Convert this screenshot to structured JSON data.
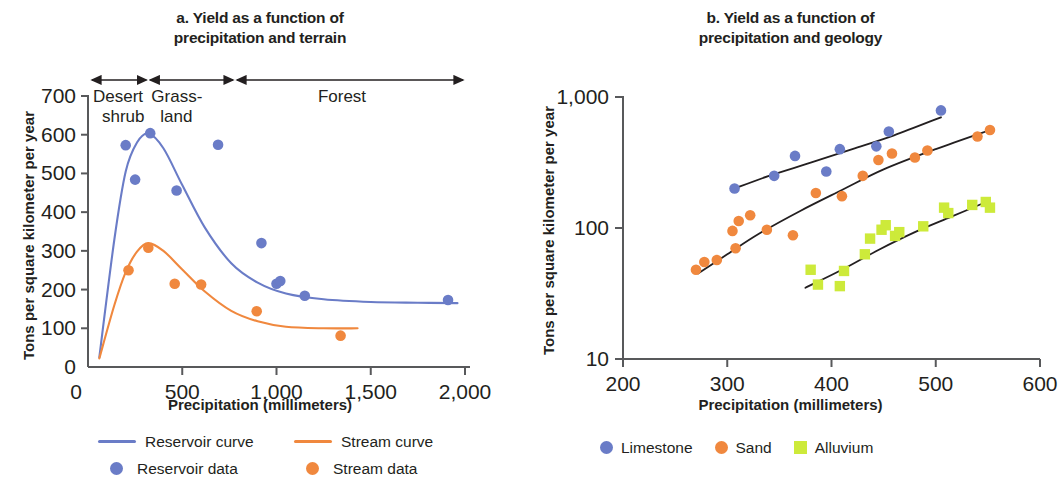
{
  "colors": {
    "reservoir_blue": "#6a7cc7",
    "stream_orange": "#f0883e",
    "limestone_blue": "#6a7cc7",
    "sand_orange": "#f0883e",
    "alluvium_green": "#cdea3a",
    "curve_black": "#231f20",
    "axis": "#58595b",
    "text": "#231f20"
  },
  "panel_a": {
    "title_line1": "a. Yield as a function of",
    "title_line2": "precipitation and terrain",
    "ylabel": "Tons per square kilometer per year",
    "xlabel": "Precipitation (millimeters)",
    "yticks": [
      "0",
      "100",
      "200",
      "300",
      "400",
      "500",
      "600",
      "700"
    ],
    "xticks": [
      "0",
      "500",
      "1,000",
      "1,500",
      "2,000"
    ],
    "terrain_bands": [
      {
        "label_line1": "Desert",
        "label_line2": "shrub",
        "from": 0,
        "to": 320
      },
      {
        "label_line1": "Grass-",
        "label_line2": "land",
        "from": 320,
        "to": 780
      },
      {
        "label_line1": "Forest",
        "label_line2": "",
        "from": 780,
        "to": 2000
      }
    ],
    "legend": [
      {
        "label": "Reservoir curve",
        "mark": "line",
        "color": "#6a7cc7"
      },
      {
        "label": "Stream curve",
        "mark": "line",
        "color": "#f0883e"
      },
      {
        "label": "Reservoir data",
        "mark": "dot",
        "color": "#6a7cc7"
      },
      {
        "label": "Stream data",
        "mark": "dot",
        "color": "#f0883e"
      }
    ]
  },
  "panel_b": {
    "title_line1": "b. Yield as a function of",
    "title_line2": "precipitation and geology",
    "ylabel": "Tons per square kilometer per year",
    "xlabel": "Precipitation (millimeters)",
    "yticks": [
      "10",
      "100",
      "1,000"
    ],
    "xticks": [
      "200",
      "300",
      "400",
      "500",
      "600"
    ],
    "legend": [
      {
        "label": "Limestone",
        "mark": "dot",
        "color": "#6a7cc7"
      },
      {
        "label": "Sand",
        "mark": "dot",
        "color": "#f0883e"
      },
      {
        "label": "Alluvium",
        "mark": "square",
        "color": "#cdea3a"
      }
    ]
  },
  "chart_data": [
    {
      "id": "panel_a",
      "type": "scatter",
      "title": "a. Yield as a function of precipitation and terrain",
      "xlabel": "Precipitation (millimeters)",
      "ylabel": "Tons per square kilometer per year",
      "xlim": [
        0,
        2000
      ],
      "ylim": [
        0,
        700
      ],
      "xticks": [
        0,
        500,
        1000,
        1500,
        2000
      ],
      "yticks": [
        0,
        100,
        200,
        300,
        400,
        500,
        600,
        700
      ],
      "xscale": "linear",
      "yscale": "linear",
      "grid": false,
      "legend_position": "below",
      "annotations": [
        {
          "text": "Desert shrub",
          "x_from": 0,
          "x_to": 320,
          "style": "double-arrow"
        },
        {
          "text": "Grass-land",
          "x_from": 320,
          "x_to": 780,
          "style": "double-arrow"
        },
        {
          "text": "Forest",
          "x_from": 780,
          "x_to": 2000,
          "style": "double-arrow"
        }
      ],
      "series": [
        {
          "name": "Reservoir data",
          "kind": "scatter",
          "marker": "circle",
          "color": "#6a7cc7",
          "points": [
            {
              "x": 200,
              "y": 573
            },
            {
              "x": 250,
              "y": 484
            },
            {
              "x": 330,
              "y": 604
            },
            {
              "x": 470,
              "y": 456
            },
            {
              "x": 690,
              "y": 574
            },
            {
              "x": 920,
              "y": 320
            },
            {
              "x": 1000,
              "y": 215
            },
            {
              "x": 1020,
              "y": 222
            },
            {
              "x": 1150,
              "y": 184
            },
            {
              "x": 1910,
              "y": 173
            }
          ]
        },
        {
          "name": "Stream data",
          "kind": "scatter",
          "marker": "circle",
          "color": "#f0883e",
          "points": [
            {
              "x": 215,
              "y": 250
            },
            {
              "x": 320,
              "y": 308
            },
            {
              "x": 460,
              "y": 215
            },
            {
              "x": 600,
              "y": 213
            },
            {
              "x": 895,
              "y": 144
            },
            {
              "x": 1340,
              "y": 81
            }
          ]
        },
        {
          "name": "Reservoir curve",
          "kind": "line",
          "color": "#6a7cc7",
          "points": [
            {
              "x": 60,
              "y": 25
            },
            {
              "x": 140,
              "y": 330
            },
            {
              "x": 200,
              "y": 505
            },
            {
              "x": 260,
              "y": 580
            },
            {
              "x": 320,
              "y": 603
            },
            {
              "x": 400,
              "y": 565
            },
            {
              "x": 500,
              "y": 470
            },
            {
              "x": 620,
              "y": 360
            },
            {
              "x": 760,
              "y": 268
            },
            {
              "x": 900,
              "y": 218
            },
            {
              "x": 1050,
              "y": 190
            },
            {
              "x": 1250,
              "y": 175
            },
            {
              "x": 1500,
              "y": 168
            },
            {
              "x": 1750,
              "y": 166
            },
            {
              "x": 1960,
              "y": 165
            }
          ]
        },
        {
          "name": "Stream curve",
          "kind": "line",
          "color": "#f0883e",
          "points": [
            {
              "x": 60,
              "y": 22
            },
            {
              "x": 140,
              "y": 160
            },
            {
              "x": 200,
              "y": 245
            },
            {
              "x": 260,
              "y": 298
            },
            {
              "x": 320,
              "y": 320
            },
            {
              "x": 400,
              "y": 300
            },
            {
              "x": 500,
              "y": 252
            },
            {
              "x": 620,
              "y": 195
            },
            {
              "x": 760,
              "y": 145
            },
            {
              "x": 900,
              "y": 118
            },
            {
              "x": 1050,
              "y": 104
            },
            {
              "x": 1250,
              "y": 100
            },
            {
              "x": 1430,
              "y": 100
            }
          ]
        }
      ]
    },
    {
      "id": "panel_b",
      "type": "scatter",
      "title": "b. Yield as a function of precipitation and geology",
      "xlabel": "Precipitation (millimeters)",
      "ylabel": "Tons per square kilometer per year",
      "xlim": [
        200,
        600
      ],
      "ylim": [
        10,
        1000
      ],
      "xticks": [
        200,
        300,
        400,
        500,
        600
      ],
      "yticks": [
        10,
        100,
        1000
      ],
      "xscale": "linear",
      "yscale": "log",
      "grid": false,
      "legend_position": "below",
      "series": [
        {
          "name": "Limestone",
          "kind": "scatter",
          "marker": "circle",
          "color": "#6a7cc7",
          "points": [
            {
              "x": 307,
              "y": 200
            },
            {
              "x": 345,
              "y": 250
            },
            {
              "x": 365,
              "y": 355
            },
            {
              "x": 395,
              "y": 270
            },
            {
              "x": 408,
              "y": 400
            },
            {
              "x": 443,
              "y": 420
            },
            {
              "x": 455,
              "y": 545
            },
            {
              "x": 505,
              "y": 790
            }
          ]
        },
        {
          "name": "Sand",
          "kind": "scatter",
          "marker": "circle",
          "color": "#f0883e",
          "points": [
            {
              "x": 270,
              "y": 48
            },
            {
              "x": 278,
              "y": 55
            },
            {
              "x": 290,
              "y": 57
            },
            {
              "x": 305,
              "y": 95
            },
            {
              "x": 308,
              "y": 70
            },
            {
              "x": 311,
              "y": 113
            },
            {
              "x": 322,
              "y": 125
            },
            {
              "x": 338,
              "y": 97
            },
            {
              "x": 363,
              "y": 88
            },
            {
              "x": 385,
              "y": 185
            },
            {
              "x": 410,
              "y": 175
            },
            {
              "x": 430,
              "y": 250
            },
            {
              "x": 445,
              "y": 330
            },
            {
              "x": 458,
              "y": 370
            },
            {
              "x": 480,
              "y": 345
            },
            {
              "x": 492,
              "y": 390
            },
            {
              "x": 540,
              "y": 500
            },
            {
              "x": 552,
              "y": 560
            }
          ]
        },
        {
          "name": "Alluvium",
          "kind": "scatter",
          "marker": "square",
          "color": "#cdea3a",
          "points": [
            {
              "x": 380,
              "y": 48
            },
            {
              "x": 387,
              "y": 37
            },
            {
              "x": 408,
              "y": 36
            },
            {
              "x": 412,
              "y": 47
            },
            {
              "x": 432,
              "y": 63
            },
            {
              "x": 437,
              "y": 83
            },
            {
              "x": 448,
              "y": 97
            },
            {
              "x": 452,
              "y": 105
            },
            {
              "x": 461,
              "y": 87
            },
            {
              "x": 465,
              "y": 93
            },
            {
              "x": 488,
              "y": 103
            },
            {
              "x": 508,
              "y": 143
            },
            {
              "x": 512,
              "y": 130
            },
            {
              "x": 535,
              "y": 150
            },
            {
              "x": 548,
              "y": 158
            },
            {
              "x": 552,
              "y": 143
            }
          ]
        },
        {
          "name": "Limestone trend",
          "kind": "line",
          "color": "#231f20",
          "points": [
            {
              "x": 307,
              "y": 200
            },
            {
              "x": 340,
              "y": 250
            },
            {
              "x": 380,
              "y": 315
            },
            {
              "x": 420,
              "y": 400
            },
            {
              "x": 460,
              "y": 510
            },
            {
              "x": 505,
              "y": 700
            }
          ]
        },
        {
          "name": "Sand trend",
          "kind": "line",
          "color": "#231f20",
          "points": [
            {
              "x": 272,
              "y": 45
            },
            {
              "x": 300,
              "y": 63
            },
            {
              "x": 330,
              "y": 90
            },
            {
              "x": 370,
              "y": 135
            },
            {
              "x": 410,
              "y": 195
            },
            {
              "x": 450,
              "y": 280
            },
            {
              "x": 500,
              "y": 400
            },
            {
              "x": 555,
              "y": 570
            }
          ]
        },
        {
          "name": "Alluvium trend",
          "kind": "line",
          "color": "#231f20",
          "points": [
            {
              "x": 375,
              "y": 35
            },
            {
              "x": 410,
              "y": 48
            },
            {
              "x": 445,
              "y": 68
            },
            {
              "x": 480,
              "y": 93
            },
            {
              "x": 515,
              "y": 122
            },
            {
              "x": 550,
              "y": 160
            }
          ]
        }
      ]
    }
  ]
}
